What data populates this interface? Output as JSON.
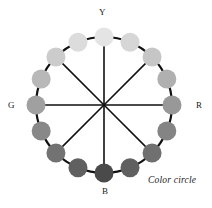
{
  "figure": {
    "caption": "Color circle",
    "background_color": "#ffffff",
    "stroke_color": "#111111",
    "center": {
      "x": 104,
      "y": 105
    },
    "ring_radius": 68,
    "node_radius": 9.5,
    "spoke_count": 8,
    "spoke_stroke_width": 1.6,
    "arc_stroke_width": 2.2
  },
  "axis_labels": [
    {
      "id": "Y",
      "text": "Y",
      "meaning": "yellow",
      "position": "top"
    },
    {
      "id": "R",
      "text": "R",
      "meaning": "red",
      "position": "right"
    },
    {
      "id": "B",
      "text": "B",
      "meaning": "blue",
      "position": "bottom"
    },
    {
      "id": "G",
      "text": "G",
      "meaning": "green",
      "position": "left"
    }
  ],
  "chart_data": {
    "type": "scatter",
    "title": "Color circle",
    "xlabel": "",
    "ylabel": "",
    "categories": [
      "Y",
      "Y-R 1",
      "Y-R 2",
      "Y-R 3",
      "R",
      "R-B 1",
      "R-B 2",
      "R-B 3",
      "B",
      "B-G 1",
      "B-G 2",
      "B-G 3",
      "G",
      "G-Y 1",
      "G-Y 2",
      "G-Y 3"
    ],
    "series": [
      {
        "name": "angle_deg_from_top_clockwise",
        "values": [
          0,
          22.5,
          45,
          67.5,
          90,
          112.5,
          135,
          157.5,
          180,
          202.5,
          225,
          247.5,
          270,
          292.5,
          315,
          337.5
        ]
      },
      {
        "name": "gray_level_0_255",
        "values": [
          228,
          214,
          198,
          176,
          152,
          132,
          112,
          96,
          74,
          96,
          114,
          136,
          160,
          184,
          204,
          220
        ]
      }
    ],
    "node_colors": [
      "#e4e4e4",
      "#d6d6d6",
      "#c6c6c6",
      "#b0b0b0",
      "#989898",
      "#848484",
      "#707070",
      "#606060",
      "#4a4a4a",
      "#606060",
      "#727272",
      "#888888",
      "#a0a0a0",
      "#b8b8b8",
      "#cccccc",
      "#dcdcdc"
    ],
    "grid": false,
    "legend": "none"
  }
}
